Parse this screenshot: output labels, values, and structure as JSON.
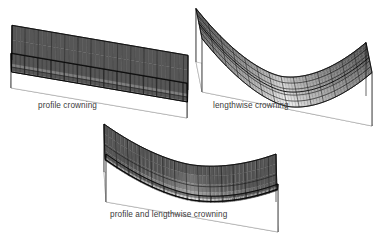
{
  "figure": {
    "kind": "technical-illustration",
    "background_color": "#ffffff",
    "line_color": "#1a1a1a",
    "base_plane_color": "#b8b8b8",
    "caption_color": "#3a3a3a"
  },
  "panels": [
    {
      "id": "panel-profile-crowning",
      "caption": "profile crowning",
      "surface": {
        "profile_curvature": "curved",
        "lengthwise_curvature": "straight",
        "mesh_columns": 12,
        "mesh_rows": 8
      }
    },
    {
      "id": "panel-lengthwise-crowning",
      "caption": "lengthwise crowning",
      "surface": {
        "profile_curvature": "straight",
        "lengthwise_curvature": "curved",
        "mesh_columns": 14,
        "mesh_rows": 14
      }
    },
    {
      "id": "panel-profile-and-lengthwise-crowning",
      "caption": "profile and lengthwise crowning",
      "surface": {
        "profile_curvature": "curved",
        "lengthwise_curvature": "curved",
        "mesh_columns": 14,
        "mesh_rows": 9
      }
    }
  ],
  "chart_data": {
    "type": "line",
    "title": "",
    "xlabel": "",
    "ylabel": "",
    "panels": [
      {
        "name": "profile crowning",
        "crown_profile": [
          1.0,
          0.45,
          0.15,
          0.02,
          0.0,
          0.0,
          0.02,
          0.15,
          0.45,
          1.0
        ],
        "crown_lengthwise": [
          0,
          0,
          0,
          0,
          0,
          0,
          0,
          0,
          0,
          0
        ]
      },
      {
        "name": "lengthwise crowning",
        "crown_profile": [
          0,
          0,
          0,
          0,
          0,
          0,
          0,
          0,
          0,
          0
        ],
        "crown_lengthwise": [
          1.0,
          0.6,
          0.3,
          0.1,
          0.0,
          0.0,
          0.1,
          0.3,
          0.6,
          1.0
        ]
      },
      {
        "name": "profile and lengthwise crowning",
        "crown_profile": [
          1.0,
          0.5,
          0.18,
          0.04,
          0.0,
          0.0,
          0.04,
          0.18,
          0.5,
          1.0
        ],
        "crown_lengthwise": [
          1.0,
          0.58,
          0.28,
          0.08,
          0.0,
          0.0,
          0.08,
          0.28,
          0.58,
          1.0
        ]
      }
    ]
  }
}
